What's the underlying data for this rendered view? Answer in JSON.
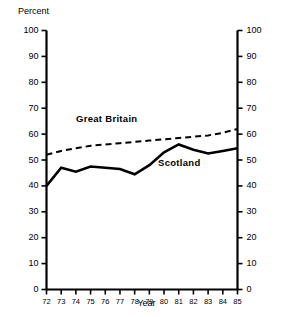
{
  "chart_data": {
    "type": "line",
    "title": "",
    "xlabel": "Year",
    "ylabel": "Percent",
    "ylim": [
      0,
      100
    ],
    "xlim": [
      72,
      85
    ],
    "grid": false,
    "legend_position": "inline-annotation",
    "yticks": [
      100,
      90,
      80,
      70,
      60,
      50,
      40,
      30,
      20,
      10,
      0
    ],
    "yticks_right": [
      100,
      90,
      80,
      70,
      60,
      50,
      40,
      30,
      20,
      10,
      0
    ],
    "x": [
      "72",
      "73",
      "74",
      "75",
      "76",
      "77",
      "78",
      "79",
      "80",
      "81",
      "82",
      "83",
      "84",
      "85"
    ],
    "series": [
      {
        "name": "Great Britain",
        "style": "dashed",
        "values": [
          52,
          53.5,
          54.5,
          55.5,
          56,
          56.5,
          57,
          57.5,
          58,
          58.5,
          59,
          59.5,
          60.5,
          62
        ]
      },
      {
        "name": "Scotland",
        "style": "solid",
        "values": [
          40,
          47,
          45.5,
          47.5,
          47,
          46.5,
          44.5,
          48,
          53,
          56,
          54,
          52.5,
          53.5,
          54.5
        ]
      }
    ]
  },
  "labels": {
    "percent": "Percent",
    "year": "Year",
    "great_britain": "Great Britain",
    "scotland": "Scotland"
  },
  "colors": {
    "line": "#000000",
    "background": "#ffffff",
    "text": "#000000"
  }
}
